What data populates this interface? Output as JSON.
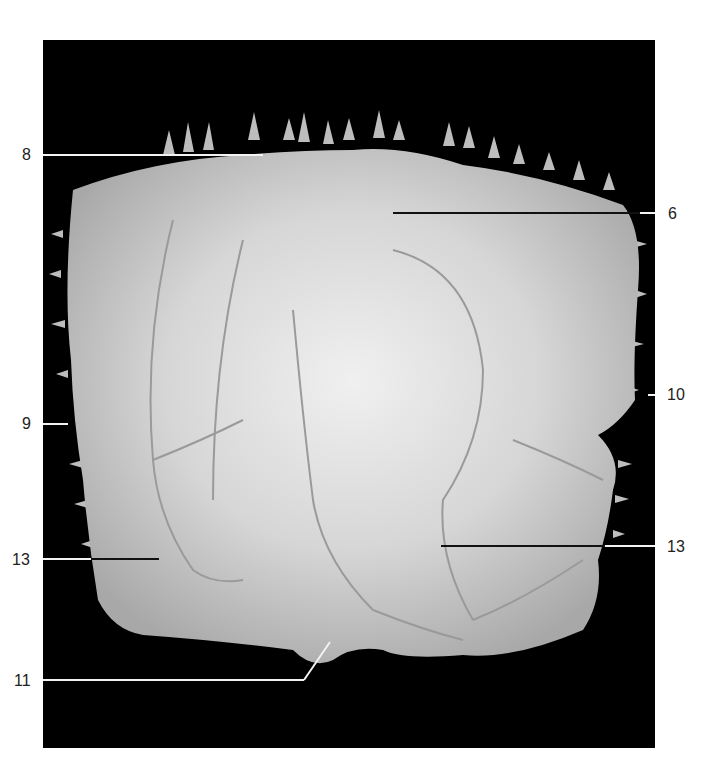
{
  "figure": {
    "background_color": "#000000",
    "bone_color": "#d8d8d8"
  },
  "labels": [
    {
      "id": "8",
      "text": "8",
      "side": "left"
    },
    {
      "id": "6",
      "text": "6",
      "side": "right"
    },
    {
      "id": "9",
      "text": "9",
      "side": "left"
    },
    {
      "id": "10",
      "text": "10",
      "side": "right"
    },
    {
      "id": "13-left",
      "text": "13",
      "side": "left"
    },
    {
      "id": "13-right",
      "text": "13",
      "side": "right"
    },
    {
      "id": "11",
      "text": "11",
      "side": "left"
    }
  ]
}
